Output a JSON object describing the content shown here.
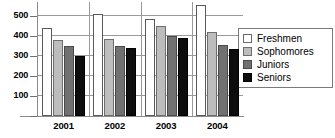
{
  "chart_data": {
    "type": "bar",
    "title": "",
    "xlabel": "",
    "ylabel": "",
    "categories": [
      "2001",
      "2002",
      "2003",
      "2004"
    ],
    "series": [
      {
        "name": "Freshmen",
        "color": "#ffffff",
        "values": [
          440,
          512,
          485,
          555
        ]
      },
      {
        "name": "Sophomores",
        "color": "#bdbdbd",
        "values": [
          382,
          386,
          450,
          420
        ]
      },
      {
        "name": "Juniors",
        "color": "#717171",
        "values": [
          350,
          350,
          402,
          355
        ]
      },
      {
        "name": "Seniors",
        "color": "#0d0d0d",
        "values": [
          302,
          340,
          388,
          333
        ]
      }
    ],
    "ylim": [
      0,
      570
    ],
    "yticks": [
      100,
      200,
      300,
      400,
      500
    ],
    "ytick_labels": [
      "100",
      "200",
      "300",
      "400",
      "500"
    ],
    "grid": true,
    "legend_position": "right"
  },
  "legend": {
    "items": [
      {
        "label": "Freshmen"
      },
      {
        "label": "Sophomores"
      },
      {
        "label": "Juniors"
      },
      {
        "label": "Seniors"
      }
    ]
  }
}
